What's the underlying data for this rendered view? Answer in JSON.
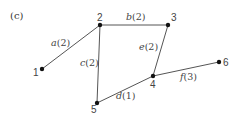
{
  "panel_label": "(c)",
  "nodes": [
    {
      "id": "1",
      "label": "1",
      "x": 42,
      "y": 69,
      "lx": 33,
      "ly": 76
    },
    {
      "id": "2",
      "label": "2",
      "x": 100,
      "y": 25,
      "lx": 97,
      "ly": 21
    },
    {
      "id": "3",
      "label": "3",
      "x": 168,
      "y": 25,
      "lx": 171,
      "ly": 21
    },
    {
      "id": "4",
      "label": "4",
      "x": 153,
      "y": 76,
      "lx": 150,
      "ly": 88
    },
    {
      "id": "5",
      "label": "5",
      "x": 97,
      "y": 103,
      "lx": 91,
      "ly": 113
    },
    {
      "id": "6",
      "label": "6",
      "x": 219,
      "y": 62,
      "lx": 223,
      "ly": 66
    }
  ],
  "edges": [
    {
      "id": "a",
      "from": "1",
      "to": "2",
      "name": "a",
      "weight": "(2)",
      "lx": 51,
      "ly": 46
    },
    {
      "id": "b",
      "from": "2",
      "to": "3",
      "name": "b",
      "weight": "(2)",
      "lx": 126,
      "ly": 20
    },
    {
      "id": "c",
      "from": "2",
      "to": "5",
      "name": "c",
      "weight": "(2)",
      "lx": 80,
      "ly": 66
    },
    {
      "id": "e",
      "from": "3",
      "to": "4",
      "name": "e",
      "weight": "(2)",
      "lx": 139,
      "ly": 50
    },
    {
      "id": "d",
      "from": "5",
      "to": "4",
      "name": "d",
      "weight": "(1)",
      "lx": 116,
      "ly": 99
    },
    {
      "id": "f",
      "from": "4",
      "to": "6",
      "name": "f",
      "weight": "(3)",
      "lx": 180,
      "ly": 80
    }
  ],
  "colors": {
    "edge": "#555555",
    "node": "#111111",
    "text": "#444444"
  }
}
